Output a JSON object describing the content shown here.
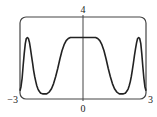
{
  "chart_data": {
    "type": "line",
    "title": "",
    "xlabel": "",
    "ylabel": "",
    "xlim": [
      -3,
      3
    ],
    "ylim": [
      0,
      4
    ],
    "grid": false,
    "legend": null,
    "tick_labels": {
      "x_left": "−3",
      "x_center": "0",
      "x_right": "3",
      "y_top": "4"
    },
    "series": [
      {
        "name": "f(x)",
        "x": [
          -3.0,
          -2.95,
          -2.9,
          -2.85,
          -2.8,
          -2.75,
          -2.7,
          -2.65,
          -2.6,
          -2.55,
          -2.5,
          -2.45,
          -2.4,
          -2.35,
          -2.3,
          -2.25,
          -2.2,
          -2.15,
          -2.1,
          -2.05,
          -2.0,
          -1.9,
          -1.8,
          -1.75,
          -1.7,
          -1.6,
          -1.5,
          -1.4,
          -1.3,
          -1.2,
          -1.1,
          -1.0,
          -0.9,
          -0.8,
          -0.7,
          -0.6,
          -0.5,
          -0.4,
          -0.2,
          0.0,
          0.2,
          0.4,
          0.5,
          0.6,
          0.7,
          0.8,
          0.9,
          1.0,
          1.1,
          1.2,
          1.3,
          1.4,
          1.5,
          1.6,
          1.7,
          1.75,
          1.8,
          1.9,
          2.0,
          2.05,
          2.1,
          2.15,
          2.2,
          2.25,
          2.3,
          2.35,
          2.4,
          2.45,
          2.5,
          2.55,
          2.6,
          2.65,
          2.7,
          2.75,
          2.8,
          2.85,
          2.9,
          2.95,
          3.0
        ],
        "y": [
          0.4,
          0.6,
          1.0,
          1.6,
          2.2,
          2.7,
          2.95,
          3.0,
          2.95,
          2.75,
          2.45,
          2.1,
          1.75,
          1.4,
          1.1,
          0.85,
          0.65,
          0.5,
          0.4,
          0.32,
          0.28,
          0.25,
          0.25,
          0.25,
          0.27,
          0.35,
          0.5,
          0.75,
          1.1,
          1.5,
          1.95,
          2.35,
          2.65,
          2.85,
          2.95,
          3.0,
          3.0,
          3.0,
          3.0,
          3.0,
          3.0,
          3.0,
          3.0,
          3.0,
          2.95,
          2.85,
          2.65,
          2.35,
          1.95,
          1.5,
          1.1,
          0.75,
          0.5,
          0.35,
          0.27,
          0.25,
          0.25,
          0.25,
          0.28,
          0.32,
          0.4,
          0.5,
          0.65,
          0.85,
          1.1,
          1.4,
          1.75,
          2.1,
          2.45,
          2.75,
          2.95,
          3.0,
          2.95,
          2.7,
          2.2,
          1.6,
          1.0,
          0.6,
          0.4
        ]
      }
    ]
  },
  "layout": {
    "box": {
      "left": 20,
      "top": 17,
      "right": 146,
      "bottom": 99,
      "radius": 6
    },
    "axis_x_pixel": 83,
    "curve_color": "#222222",
    "frame_color": "#444444"
  }
}
